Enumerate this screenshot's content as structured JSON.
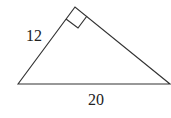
{
  "diagram": {
    "type": "right-triangle",
    "vertices": {
      "bottom_left": [
        18,
        84
      ],
      "top": [
        75,
        7
      ],
      "bottom_right": [
        170,
        84
      ]
    },
    "right_angle_at": "top",
    "labels": {
      "leg": "12",
      "hypotenuse": "20"
    },
    "stroke_color": "#333333"
  }
}
